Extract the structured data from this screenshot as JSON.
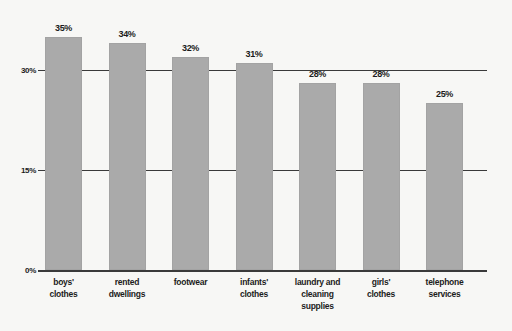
{
  "chart_data": {
    "type": "bar",
    "title": "",
    "subtitle": "",
    "xlabel": "",
    "ylabel": "",
    "ylim": [
      0,
      37.5
    ],
    "grid": true,
    "legend": false,
    "orientation": "vertical",
    "bar_color": "#aaaaaa",
    "axis_color": "#3a3a3a",
    "background_color": "#f7f7f5",
    "categories": [
      "boys' clothes",
      "rented dwellings",
      "footwear",
      "infants' clothes",
      "laundry and cleaning supplies",
      "girls' clothes",
      "telephone services"
    ],
    "category_lines": [
      [
        "boys'",
        "clothes"
      ],
      [
        "rented",
        "dwellings"
      ],
      [
        "footwear"
      ],
      [
        "infants'",
        "clothes"
      ],
      [
        "laundry and",
        "cleaning",
        "supplies"
      ],
      [
        "girls'",
        "clothes"
      ],
      [
        "telephone",
        "services"
      ]
    ],
    "values": [
      35,
      34,
      32,
      31,
      28,
      28,
      25
    ],
    "value_labels": [
      "35%",
      "34%",
      "32%",
      "31%",
      "28%",
      "28%",
      "25%"
    ],
    "yticks": [
      0,
      15,
      30
    ],
    "ytick_labels": [
      "0%",
      "15%",
      "30%"
    ],
    "gridline_values": [
      15,
      30
    ]
  }
}
